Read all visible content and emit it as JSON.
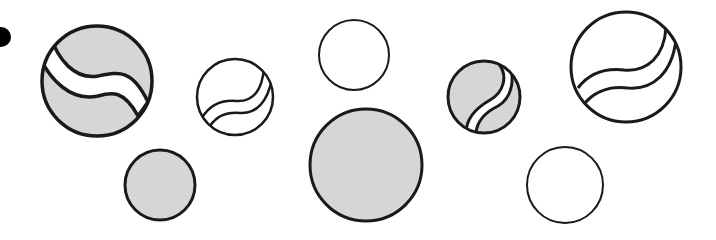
{
  "figure": {
    "width": 716,
    "height": 240,
    "background": "#ffffff",
    "stroke_color": "#1a1a1a",
    "fill_gray": "#d6d6d6",
    "fill_white": "#ffffff"
  },
  "shapes": [
    {
      "id": "dot",
      "type": "dot",
      "cx": 1,
      "cy": 37,
      "r": 10,
      "fill": "#000000"
    },
    {
      "id": "c1",
      "type": "circle-wave",
      "cx": 97,
      "cy": 81,
      "r": 56,
      "fill": "gray",
      "stroke": 3.5,
      "wave": "horizontal"
    },
    {
      "id": "c2",
      "type": "circle-wave",
      "cx": 235,
      "cy": 97,
      "r": 39,
      "fill": "white",
      "stroke": 2.5,
      "wave": "horizontal-right"
    },
    {
      "id": "c3",
      "type": "circle",
      "cx": 354,
      "cy": 55,
      "r": 35,
      "fill": "white",
      "stroke": 2
    },
    {
      "id": "c4",
      "type": "circle",
      "cx": 366,
      "cy": 165,
      "r": 57,
      "fill": "gray",
      "stroke": 3
    },
    {
      "id": "c5",
      "type": "circle-wave",
      "cx": 484,
      "cy": 97,
      "r": 37,
      "fill": "gray",
      "stroke": 3,
      "wave": "vertical"
    },
    {
      "id": "c6",
      "type": "circle-wave",
      "cx": 626,
      "cy": 67,
      "r": 56,
      "fill": "white",
      "stroke": 3,
      "wave": "horizontal-right"
    },
    {
      "id": "c7",
      "type": "circle",
      "cx": 160,
      "cy": 185,
      "r": 36,
      "fill": "gray",
      "stroke": 3
    },
    {
      "id": "c8",
      "type": "circle",
      "cx": 565,
      "cy": 185,
      "r": 39,
      "fill": "white",
      "stroke": 2
    }
  ]
}
